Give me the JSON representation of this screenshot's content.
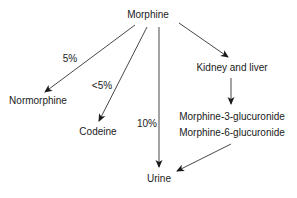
{
  "diagram": {
    "type": "metabolism-flow",
    "nodes": {
      "morphine": "Morphine",
      "normorphine": "Normorphine",
      "codeine": "Codeine",
      "urine": "Urine",
      "kidney_liver": "Kidney and liver",
      "m3g": "Morphine-3-glucuronide",
      "m6g": "Morphine-6-glucuronide"
    },
    "edge_labels": {
      "to_normorphine": "5%",
      "to_codeine": "<5%",
      "to_urine": "10%"
    },
    "edges": [
      {
        "from": "Morphine",
        "to": "Normorphine",
        "label": "5%"
      },
      {
        "from": "Morphine",
        "to": "Codeine",
        "label": "<5%"
      },
      {
        "from": "Morphine",
        "to": "Urine",
        "label": "10%"
      },
      {
        "from": "Morphine",
        "to": "Kidney and liver",
        "label": ""
      },
      {
        "from": "Kidney and liver",
        "to": "Morphine-3-glucuronide / Morphine-6-glucuronide",
        "label": ""
      },
      {
        "from": "Morphine-3-glucuronide / Morphine-6-glucuronide",
        "to": "Urine",
        "label": ""
      }
    ]
  }
}
